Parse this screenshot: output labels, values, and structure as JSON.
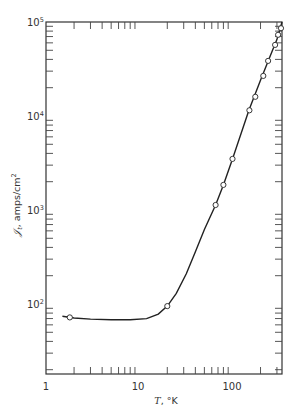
{
  "chart_data": {
    "type": "line",
    "title": "",
    "xlabel": "T, °K",
    "ylabel": "𝒥t, amps/cm²",
    "x_scale": "log",
    "y_scale": "log",
    "xlim": [
      1,
      340
    ],
    "ylim": [
      18,
      100000
    ],
    "grid": false,
    "legend": null,
    "x_tick_labels": [
      "1",
      "10",
      "100"
    ],
    "y_tick_labels": [
      "10^2",
      "10^3",
      "10^4",
      "10^5"
    ],
    "series": [
      {
        "name": "measured points",
        "marker": "open-circle",
        "x": [
          1.8,
          20,
          66,
          80,
          100,
          152,
          176,
          214,
          241,
          287,
          309,
          332
        ],
        "y": [
          72,
          95,
          1130,
          1850,
          3500,
          11500,
          16000,
          26700,
          38600,
          57000,
          73000,
          86000
        ]
      },
      {
        "name": "fitted curve",
        "marker": "none",
        "x": [
          1.5,
          2,
          3,
          5,
          8,
          12,
          16,
          20,
          25,
          32,
          40,
          50,
          66,
          80,
          100,
          150,
          200,
          250,
          300,
          340
        ],
        "y": [
          74,
          71,
          69,
          68,
          68,
          70,
          78,
          95,
          130,
          210,
          360,
          620,
          1130,
          1850,
          3500,
          11500,
          24000,
          42000,
          65000,
          100000
        ]
      }
    ]
  },
  "axes": {
    "x_label_main": "T",
    "x_label_unit": ", °K",
    "y_label_main": "𝒥",
    "y_label_sub": "t",
    "y_label_unit": ", amps/cm",
    "y_label_sup": "2",
    "x_ticks": {
      "t1": "1",
      "t10": "10",
      "t100": "100"
    },
    "y_ticks": {
      "e2_base": "10",
      "e2_exp": "2",
      "e3_base": "10",
      "e3_exp": "3",
      "e4_base": "10",
      "e4_exp": "4",
      "e5_base": "10",
      "e5_exp": "5"
    }
  }
}
